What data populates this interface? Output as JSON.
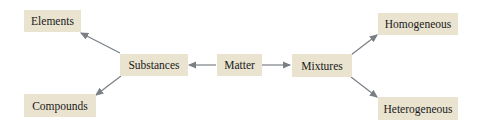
{
  "diagram": {
    "nodes": {
      "elements": "Elements",
      "compounds": "Compounds",
      "substances": "Substances",
      "matter": "Matter",
      "mixtures": "Mixtures",
      "homogeneous": "Homogeneous",
      "heterogeneous": "Heterogeneous"
    },
    "edges": [
      {
        "from": "Matter",
        "to": "Substances"
      },
      {
        "from": "Matter",
        "to": "Mixtures"
      },
      {
        "from": "Substances",
        "to": "Elements"
      },
      {
        "from": "Substances",
        "to": "Compounds"
      },
      {
        "from": "Mixtures",
        "to": "Homogeneous"
      },
      {
        "from": "Mixtures",
        "to": "Heterogeneous"
      }
    ],
    "colors": {
      "node_fill": "#e9e3cf",
      "arrow": "#7a7f86",
      "text": "#1a1a1a"
    }
  }
}
